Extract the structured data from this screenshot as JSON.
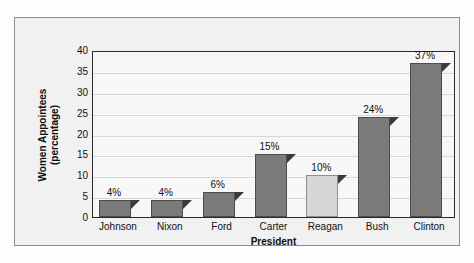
{
  "chart_data": {
    "type": "bar",
    "title": "",
    "subtitle": "",
    "xlabel": "President",
    "ylabel": "Women Appointees (percentage)",
    "ylabel_line1": "Women Appointees",
    "ylabel_line2": "(percentage)",
    "categories": [
      "Johnson",
      "Nixon",
      "Ford",
      "Carter",
      "Reagan",
      "Bush",
      "Clinton"
    ],
    "values": [
      4,
      4,
      6,
      15,
      10,
      24,
      37
    ],
    "value_labels": [
      "4%",
      "4%",
      "6%",
      "15%",
      "10%",
      "24%",
      "37%"
    ],
    "ylim": [
      0,
      40
    ],
    "ytick_values": [
      40,
      35,
      30,
      25,
      20,
      15,
      10,
      5,
      0
    ],
    "ytick_labels": [
      "40",
      "35",
      "30",
      "25",
      "20",
      "15",
      "10",
      "5",
      "0"
    ],
    "grid": true,
    "legend": false,
    "legend_position": "none",
    "bar_colors": [
      "#7b7b7b",
      "#7b7b7b",
      "#7b7b7b",
      "#7b7b7b",
      "#d6d6d6",
      "#7b7b7b",
      "#7b7b7b"
    ],
    "highlight_category": "Reagan",
    "colors": {
      "bar_dark": "#7b7b7b",
      "bar_light": "#d6d6d6",
      "bar_outline": "#4c4c4c",
      "shadow": "#3b3b3b",
      "plot_background": "#f7f7f7",
      "figure_background": "#f2f2f2",
      "axis_line": "#2a2a2a",
      "frame_line": "#8d8d8d",
      "text": "#111111"
    }
  }
}
